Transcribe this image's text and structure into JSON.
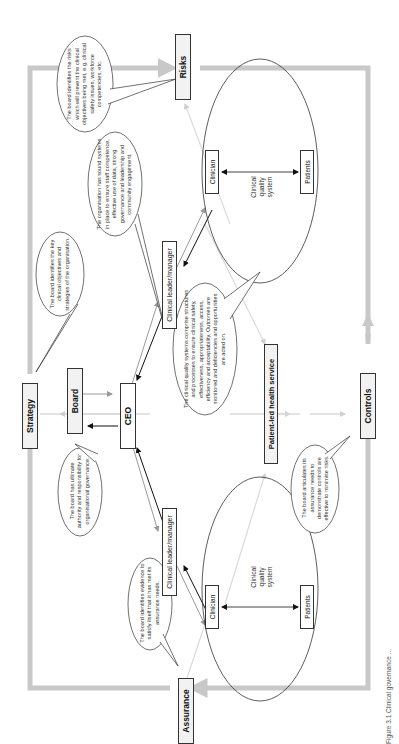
{
  "diagram": {
    "nodes": {
      "strategy": "Strategy",
      "board": "Board",
      "ceo": "CEO",
      "risks": "Risks",
      "controls": "Controls",
      "assurance": "Assurance",
      "patient_led": "Patient-led health service",
      "leader_left": "Clinical leader/manager",
      "leader_right": "Clinical leader/manager",
      "clinician_left": "Clinician",
      "patients_left": "Patients",
      "clinician_right": "Clinician",
      "patients_right": "Patients",
      "cqs_left": "Clinical quality system",
      "cqs_right": "Clinical quality system"
    },
    "callouts": {
      "risks": "The board identifies the risks which will prevent the clinical objectives being met, e.g. clinical safety issues, workforce competencies, etc.",
      "strategy": "The board identifies the key clinical objectives and strategies of the organisation.",
      "organisation": "The organisation has sound systems in place to ensure staff competence, effective use of data, strong governance and leadership and community engagement.",
      "cqs": "The clinical quality systems comprise structures and processes to ensure clinical safety, effectiveness, appropriateness, access, efficiency and acceptability. Outcomes are monitored and deficiencies and opportunities are acted on.",
      "board": "The board has ultimate authority and responsibility for organisational governance.",
      "assurance": "The board identifies evidence to satisfy itself that it has met its assurance needs.",
      "controls": "The board articulates its assurance needs to demonstrate controls are effective to minimise risks."
    },
    "caption": "Figure 3.1 Clinical governance ...",
    "colors": {
      "cycle_arrow": "#c8c8c8",
      "light_arrow": "#d9d9d9",
      "dark_arrow": "#111111",
      "box_fill": "#f2f2f2"
    }
  }
}
